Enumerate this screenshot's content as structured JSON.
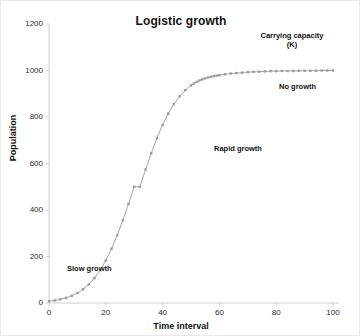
{
  "chart_data": {
    "type": "line",
    "title": "Logistic growth",
    "xlabel": "Time interval",
    "ylabel": "Population",
    "xlim": [
      0,
      100
    ],
    "ylim": [
      0,
      1200
    ],
    "xticks": [
      0,
      20,
      40,
      60,
      80,
      100
    ],
    "yticks": [
      0,
      200,
      400,
      600,
      800,
      1000,
      1200
    ],
    "grid": false,
    "legend": false,
    "series": [
      {
        "name": "Population",
        "color": "#9a9a9a",
        "marker": "square",
        "x": [
          0,
          2,
          4,
          6,
          8,
          10,
          12,
          14,
          16,
          18,
          20,
          22,
          24,
          26,
          28,
          30,
          32,
          34,
          36,
          38,
          40,
          42,
          44,
          46,
          48,
          50,
          51,
          52,
          53,
          54,
          55,
          56,
          57,
          58,
          59,
          60,
          62,
          64,
          66,
          68,
          70,
          72,
          74,
          76,
          78,
          80,
          82,
          84,
          86,
          88,
          90,
          92,
          94,
          96,
          98,
          100
        ],
        "y": [
          8,
          11,
          16,
          22,
          31,
          43,
          59,
          80,
          107,
          141,
          183,
          233,
          291,
          356,
          426,
          500,
          500,
          574,
          644,
          709,
          766,
          815,
          856,
          889,
          915,
          936,
          944,
          951,
          957,
          962,
          966,
          970,
          973,
          976,
          978,
          980,
          984,
          987,
          989,
          991,
          993,
          994,
          995,
          996,
          997,
          997,
          998,
          998,
          998,
          999,
          999,
          999,
          999,
          1000,
          1000,
          1000
        ]
      }
    ],
    "annotations": [
      {
        "text": "Carrying capacity",
        "x": 83,
        "y": 1135
      },
      {
        "text": "(K)",
        "x": 83,
        "y": 1085
      },
      {
        "text": "No growth",
        "x": 88,
        "y": 925
      },
      {
        "text": "Rapid growth",
        "x": 63,
        "y": 640
      },
      {
        "text": "Slow growth",
        "x": 22,
        "y": 120
      }
    ]
  },
  "axis": {
    "y_tick_labels": [
      "1200",
      "1000",
      "800",
      "600",
      "400",
      "200",
      "0"
    ],
    "x_tick_labels": [
      "0",
      "20",
      "40",
      "60",
      "80",
      "100"
    ]
  },
  "annotations": {
    "carrying_capacity_line1": "Carrying capacity",
    "carrying_capacity_line2": "(K)",
    "no_growth": "No growth",
    "rapid_growth": "Rapid growth",
    "slow_growth": "Slow growth"
  },
  "colors": {
    "series": "#9a9a9a",
    "axis": "#d0d0d0",
    "text": "#111111"
  }
}
